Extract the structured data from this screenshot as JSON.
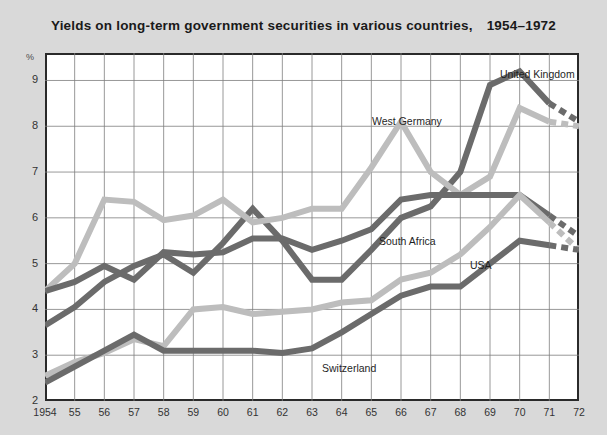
{
  "figure": {
    "title_main": "Yields on long-term government securities in various countries,",
    "title_years": "1954–1972",
    "background_color": "#d9d9d9",
    "plot_background": "#ffffff",
    "border_color": "#2a2a2a"
  },
  "axis": {
    "y_unit_label": "%",
    "y_ticks": [
      "9",
      "8",
      "7",
      "6",
      "5",
      "4",
      "3",
      "2"
    ],
    "x_ticks": [
      "1954",
      "55",
      "56",
      "57",
      "58",
      "59",
      "60",
      "61",
      "62",
      "63",
      "64",
      "65",
      "66",
      "67",
      "68",
      "69",
      "70",
      "71",
      "72"
    ]
  },
  "series_labels": [
    {
      "name": "united-kingdom",
      "text": "United Kingdom",
      "left": 500,
      "top": 68
    },
    {
      "name": "west-germany",
      "text": "West Germany",
      "left": 372,
      "top": 115
    },
    {
      "name": "south-africa",
      "text": "South Africa",
      "left": 379,
      "top": 235
    },
    {
      "name": "usa",
      "text": "USA",
      "left": 470,
      "top": 259
    },
    {
      "name": "switzerland",
      "text": "Switzerland",
      "left": 322,
      "top": 362
    }
  ],
  "colors": {
    "dark_line": "#6b6b6b",
    "light_line": "#bdbdbd",
    "grid": "#7d7d7d",
    "text": "#1f1f1f"
  },
  "chart_data": {
    "type": "line",
    "xlabel": "",
    "ylabel": "%",
    "xlim": [
      1954,
      1972
    ],
    "ylim": [
      2,
      9.6
    ],
    "grid": true,
    "legend": "inline-labels",
    "x": [
      1954,
      1955,
      1956,
      1957,
      1958,
      1959,
      1960,
      1961,
      1962,
      1963,
      1964,
      1965,
      1966,
      1967,
      1968,
      1969,
      1970,
      1971,
      1972
    ],
    "series": [
      {
        "name": "United Kingdom",
        "color": "#6b6b6b",
        "style": "solid",
        "values": [
          3.65,
          4.05,
          4.6,
          4.95,
          5.2,
          4.8,
          5.45,
          6.2,
          5.5,
          4.65,
          4.65,
          5.3,
          6.0,
          6.25,
          7.0,
          8.9,
          9.2,
          8.5,
          8.1
        ],
        "dashed_from": 1971
      },
      {
        "name": "West Germany",
        "color": "#bdbdbd",
        "style": "solid",
        "values": [
          4.4,
          5.0,
          6.4,
          6.35,
          5.95,
          6.05,
          6.4,
          5.9,
          6.0,
          6.2,
          6.2,
          7.1,
          8.1,
          7.0,
          6.5,
          6.9,
          8.4,
          8.1,
          8.0
        ],
        "dashed_from": 1971
      },
      {
        "name": "South Africa",
        "color": "#6b6b6b",
        "style": "solid",
        "values": [
          4.4,
          4.6,
          4.95,
          4.65,
          5.25,
          5.2,
          5.25,
          5.55,
          5.55,
          5.3,
          5.5,
          5.75,
          6.4,
          6.5,
          6.5,
          6.5,
          6.5,
          6.05,
          5.6
        ],
        "dashed_from": 1971
      },
      {
        "name": "USA",
        "color": "#bdbdbd",
        "style": "solid",
        "values": [
          2.55,
          2.85,
          3.05,
          3.35,
          3.2,
          4.0,
          4.05,
          3.9,
          3.95,
          4.0,
          4.15,
          4.2,
          4.65,
          4.8,
          5.2,
          5.8,
          6.5,
          5.9,
          5.3
        ],
        "dashed_from": 1971
      },
      {
        "name": "Switzerland",
        "color": "#6b6b6b",
        "style": "solid",
        "values": [
          2.4,
          2.75,
          3.1,
          3.45,
          3.1,
          3.1,
          3.1,
          3.1,
          3.05,
          3.15,
          3.5,
          3.9,
          4.3,
          4.5,
          4.5,
          5.0,
          5.5,
          5.4,
          5.3
        ],
        "dashed_from": 1971
      }
    ]
  }
}
